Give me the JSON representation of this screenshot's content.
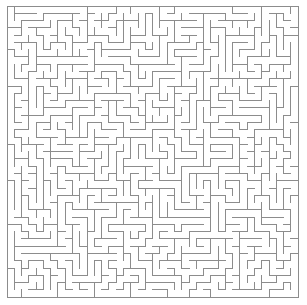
{
  "document": {
    "title": "Maze",
    "kind": "maze-puzzle",
    "background_color": "#ffffff"
  },
  "canvas": {
    "width": 307,
    "height": 305
  },
  "maze": {
    "name": "rectangular-perfect-maze",
    "columns": 40,
    "rows": 40,
    "cell_size": 7.28,
    "origin_x": 7,
    "origin_y": 6,
    "wall_color": "#8c8c8c",
    "border_color": "#8c8c8c",
    "wall_thickness": 1,
    "background_color": "#ffffff",
    "border_closed": true,
    "has_entrance_marker": false,
    "has_exit_marker": false,
    "has_solution_path": false,
    "labels": [],
    "seed": 20240412
  }
}
